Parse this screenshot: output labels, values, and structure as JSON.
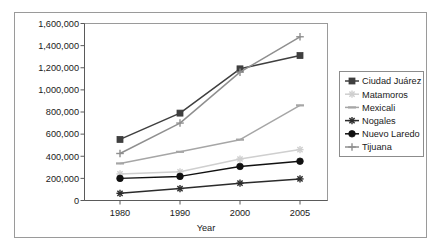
{
  "chart_data": {
    "type": "line",
    "title": "",
    "xlabel": "Year",
    "ylabel": "",
    "x": [
      "1980",
      "1990",
      "2000",
      "2005"
    ],
    "categories": [
      "1980",
      "1990",
      "2000",
      "2005"
    ],
    "ylim": [
      0,
      1600000
    ],
    "ytick_labels": [
      "0",
      "200,000",
      "400,000",
      "600,000",
      "800,000",
      "1,000,000",
      "1,200,000",
      "1,400,000",
      "1,600,000"
    ],
    "ytick_values": [
      0,
      200000,
      400000,
      600000,
      800000,
      1000000,
      1200000,
      1400000,
      1600000
    ],
    "grid": false,
    "legend_position": "right",
    "series": [
      {
        "name": "Ciudad Juárez",
        "values": [
          552000,
          790000,
          1190000,
          1310000
        ],
        "color": "#3f3f3f",
        "marker": "square"
      },
      {
        "name": "Matamoros",
        "values": [
          240000,
          260000,
          375000,
          460000
        ],
        "color": "#cfcfcf",
        "marker": "star"
      },
      {
        "name": "Mexicali",
        "values": [
          335000,
          440000,
          550000,
          860000
        ],
        "color": "#a6a6a6",
        "marker": "dash"
      },
      {
        "name": "Nogales",
        "values": [
          65000,
          108000,
          157000,
          195000
        ],
        "color": "#2b2b2b",
        "marker": "star"
      },
      {
        "name": "Nuevo Laredo",
        "values": [
          200000,
          218000,
          308000,
          355000
        ],
        "color": "#111111",
        "marker": "circle"
      },
      {
        "name": "Tijuana",
        "values": [
          425000,
          700000,
          1160000,
          1480000
        ],
        "color": "#8f8f8f",
        "marker": "plus"
      }
    ]
  },
  "legend": {
    "items": [
      {
        "label": "Ciudad Juárez"
      },
      {
        "label": "Matamoros"
      },
      {
        "label": "Mexicali"
      },
      {
        "label": "Nogales"
      },
      {
        "label": "Nuevo Laredo"
      },
      {
        "label": "Tijuana"
      }
    ]
  },
  "axes": {
    "x_title": "Year",
    "x_ticks": [
      "1980",
      "1990",
      "2000",
      "2005"
    ],
    "y_ticks": [
      "1,600,000",
      "1,400,000",
      "1,200,000",
      "1,000,000",
      "800,000",
      "600,000",
      "400,000",
      "200,000",
      "0"
    ]
  }
}
